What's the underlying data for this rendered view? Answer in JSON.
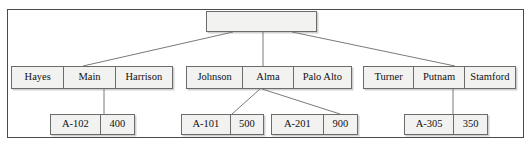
{
  "diagram": {
    "root": {
      "label": "",
      "cells": [
        ""
      ]
    },
    "branch_nodes": [
      {
        "name": "branch-node-left",
        "cells": [
          "Hayes",
          "Main",
          "Harrison"
        ]
      },
      {
        "name": "branch-node-middle",
        "cells": [
          "Johnson",
          "Alma",
          "Palo Alto"
        ]
      },
      {
        "name": "branch-node-right",
        "cells": [
          "Turner",
          "Putnam",
          "Stamford"
        ]
      }
    ],
    "record_nodes": [
      {
        "name": "record-a-102",
        "cells": [
          "A-102",
          "400"
        ]
      },
      {
        "name": "record-a-101",
        "cells": [
          "A-101",
          "500"
        ]
      },
      {
        "name": "record-a-201",
        "cells": [
          "A-201",
          "900"
        ]
      },
      {
        "name": "record-a-305",
        "cells": [
          "A-305",
          "350"
        ]
      }
    ],
    "colors": {
      "frame_border": "#4a4a4a",
      "node_border": "#6b6b6b",
      "node_fill": "#f2f2f0",
      "connector": "#7a7a7a",
      "text": "#101010",
      "background": "#ffffff"
    }
  }
}
